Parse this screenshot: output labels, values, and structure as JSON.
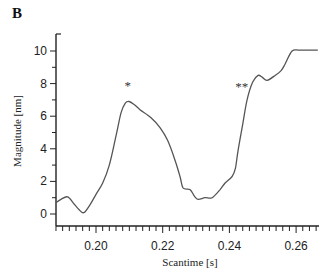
{
  "panel_label": "B",
  "chart_data": {
    "type": "line",
    "title": "",
    "xlabel": "Scantime [s]",
    "ylabel": "Magnitude [nm]",
    "xlim": [
      0.188,
      0.2665
    ],
    "ylim": [
      -0.7,
      11
    ],
    "xticks": [
      0.2,
      0.22,
      0.24,
      0.26
    ],
    "xtick_labels": [
      "0.20",
      "0.22",
      "0.24",
      "0.26"
    ],
    "yticks": [
      0,
      2,
      4,
      6,
      8,
      10
    ],
    "ytick_labels": [
      "0",
      "2",
      "4",
      "6",
      "8",
      "10"
    ],
    "grid": false,
    "legend": null,
    "annotations": [
      {
        "text": "*",
        "x": 0.2095,
        "y": 8.0
      },
      {
        "text": "**",
        "x": 0.2437,
        "y": 7.9
      }
    ],
    "series": [
      {
        "name": "magnitude",
        "color": "#555555",
        "x": [
          0.188,
          0.1895,
          0.1915,
          0.1935,
          0.1955,
          0.1965,
          0.198,
          0.2,
          0.202,
          0.204,
          0.206,
          0.2075,
          0.2088,
          0.2099,
          0.2115,
          0.2132,
          0.2165,
          0.2192,
          0.2215,
          0.2237,
          0.2252,
          0.2261,
          0.2282,
          0.2295,
          0.2306,
          0.2327,
          0.2348,
          0.2372,
          0.2387,
          0.2408,
          0.2418,
          0.2426,
          0.244,
          0.2453,
          0.247,
          0.2486,
          0.2498,
          0.2513,
          0.2537,
          0.2555,
          0.2567,
          0.2588,
          0.2612,
          0.2665
        ],
        "y": [
          0.7,
          0.9,
          1.05,
          0.6,
          0.15,
          0.1,
          0.5,
          1.2,
          1.9,
          3.0,
          4.8,
          6.2,
          6.8,
          6.9,
          6.7,
          6.4,
          5.9,
          5.3,
          4.5,
          3.3,
          2.3,
          1.6,
          1.5,
          1.1,
          0.9,
          1.0,
          1.0,
          1.5,
          1.9,
          2.3,
          2.8,
          3.9,
          5.5,
          7.0,
          8.1,
          8.5,
          8.4,
          8.2,
          8.5,
          8.8,
          9.2,
          10.0,
          10.05,
          10.05
        ]
      }
    ]
  }
}
